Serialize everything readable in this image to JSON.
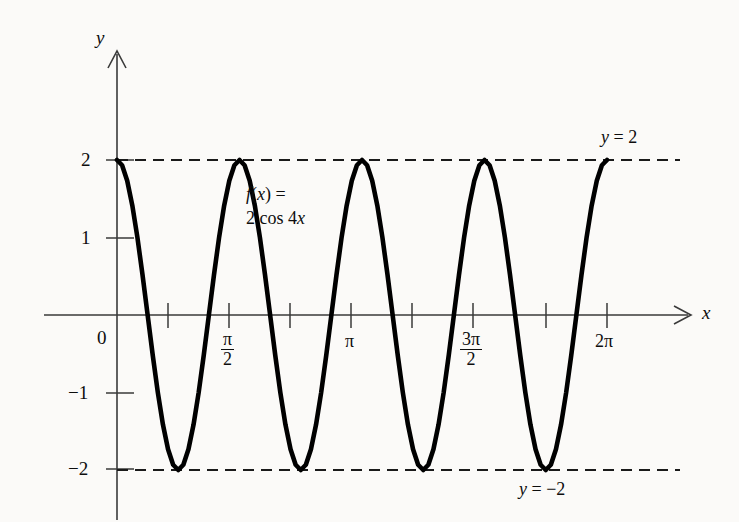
{
  "figure": {
    "background_color": "#fbfaf8",
    "ink_color": "#0d0d0d",
    "curve_color": "#000000",
    "axis_color": "#3a3a3a"
  },
  "axes": {
    "y_axis_name": "y",
    "x_axis_name": "x",
    "origin_label": "0"
  },
  "y_ticks": [
    {
      "label": "2",
      "value": 2
    },
    {
      "label": "1",
      "value": 1
    },
    {
      "label": "−1",
      "value": -1
    },
    {
      "label": "−2",
      "value": -2
    }
  ],
  "x_ticks": [
    {
      "label": "",
      "value": 0.7853981634,
      "kind": "plain"
    },
    {
      "label": "π",
      "sub": "2",
      "value": 1.5707963268,
      "kind": "fraction"
    },
    {
      "label": "π",
      "value": 3.1415926536,
      "kind": "plain"
    },
    {
      "label": "3π",
      "sub": "2",
      "value": 4.7123889804,
      "kind": "fraction"
    },
    {
      "label": "2π",
      "value": 6.2831853072,
      "kind": "plain"
    }
  ],
  "function_label": {
    "line1_prefix": "f",
    "line1_paren_open": "(",
    "line1_var": "x",
    "line1_paren_close": ")",
    "line1_equals": " =",
    "line2_coefficient": "2 cos 4",
    "line2_var": "x"
  },
  "asymptotes": [
    {
      "name": "upper",
      "text_prefix": "y",
      "text_rest": " = 2",
      "value": 2
    },
    {
      "name": "lower",
      "text_prefix": "y",
      "text_rest": " = −2",
      "value": -2
    }
  ],
  "chart_data": {
    "type": "line",
    "title": "",
    "subtitle": "",
    "xlabel": "x",
    "ylabel": "y",
    "function_expression": "f(x) = 2 cos 4x",
    "amplitude": 2,
    "frequency_multiplier": 4,
    "period": 1.5707963268,
    "number_of_cycles": 4,
    "xlim": [
      0,
      6.2831853072
    ],
    "ylim": [
      -2,
      2
    ],
    "grid": false,
    "legend_position": "none",
    "x_tick_values": [
      0.7853981634,
      1.5707963268,
      3.1415926536,
      4.7123889804,
      6.2831853072
    ],
    "x_tick_labels": [
      "",
      "π/2",
      "π",
      "3π/2",
      "2π"
    ],
    "y_tick_values": [
      2,
      1,
      -1,
      -2
    ],
    "y_tick_labels": [
      "2",
      "1",
      "−1",
      "−2"
    ],
    "annotations": [
      {
        "text": "f(x) = 2 cos 4x",
        "x": 1.75,
        "y": 1.45
      },
      {
        "text": "y = 2",
        "x": 5.55,
        "y": 2.32
      },
      {
        "text": "y = −2",
        "x": 5.6,
        "y": -2.3
      }
    ],
    "reference_lines": [
      {
        "text": "y = 2",
        "y": 2,
        "style": "dashed"
      },
      {
        "text": "y = −2",
        "y": -2,
        "style": "dashed"
      }
    ],
    "x": [
      0,
      0.0654,
      0.1309,
      0.1963,
      0.2618,
      0.3272,
      0.3927,
      0.4581,
      0.5236,
      0.589,
      0.6545,
      0.7199,
      0.7854,
      0.8508,
      0.9163,
      0.9817,
      1.0472,
      1.1126,
      1.1781,
      1.2435,
      1.309,
      1.3744,
      1.4399,
      1.5053,
      1.5708,
      1.6362,
      1.7017,
      1.7671,
      1.8326,
      1.898,
      1.9635,
      2.0289,
      2.0944,
      2.1598,
      2.2253,
      2.2907,
      2.3562,
      2.4216,
      2.4871,
      2.5525,
      2.618,
      2.6834,
      2.7489,
      2.8143,
      2.8798,
      2.9452,
      3.0107,
      3.0761,
      3.1416,
      3.207,
      3.2725,
      3.3379,
      3.4034,
      3.4688,
      3.5343,
      3.5997,
      3.6652,
      3.7306,
      3.7961,
      3.8615,
      3.927,
      3.9924,
      4.0579,
      4.1233,
      4.1888,
      4.2542,
      4.3197,
      4.3851,
      4.4506,
      4.516,
      4.5815,
      4.6469,
      4.7124,
      4.7778,
      4.8433,
      4.9087,
      4.9742,
      5.0396,
      5.1051,
      5.1705,
      5.236,
      5.3014,
      5.3669,
      5.4323,
      5.4978,
      5.5632,
      5.6287,
      5.6941,
      5.7596,
      5.825,
      5.8905,
      5.9559,
      6.0214,
      6.0868,
      6.1523,
      6.2177,
      6.2832
    ],
    "y": [
      2,
      1.932,
      1.732,
      1.414,
      1,
      0.518,
      0,
      -0.518,
      -1,
      -1.414,
      -1.732,
      -1.932,
      -2,
      -1.932,
      -1.732,
      -1.414,
      -1,
      -0.518,
      0,
      0.518,
      1,
      1.414,
      1.732,
      1.932,
      2,
      1.932,
      1.732,
      1.414,
      1,
      0.518,
      0,
      -0.518,
      -1,
      -1.414,
      -1.732,
      -1.932,
      -2,
      -1.932,
      -1.732,
      -1.414,
      -1,
      -0.518,
      0,
      0.518,
      1,
      1.414,
      1.732,
      1.932,
      2,
      1.932,
      1.732,
      1.414,
      1,
      0.518,
      0,
      -0.518,
      -1,
      -1.414,
      -1.732,
      -1.932,
      -2,
      -1.932,
      -1.732,
      -1.414,
      -1,
      -0.518,
      0,
      0.518,
      1,
      1.414,
      1.732,
      1.932,
      2,
      1.932,
      1.732,
      1.414,
      1,
      0.518,
      0,
      -0.518,
      -1,
      -1.414,
      -1.732,
      -1.932,
      -2,
      -1.932,
      -1.732,
      -1.414,
      -1,
      -0.518,
      0,
      0.518,
      1,
      1.414,
      1.732,
      1.932,
      2
    ]
  }
}
